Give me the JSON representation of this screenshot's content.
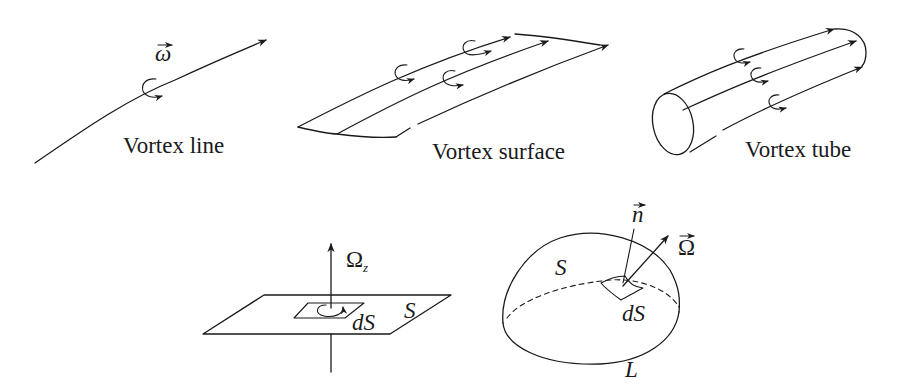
{
  "figure": {
    "panels": [
      {
        "id": "vortex-line",
        "caption": "Vortex line",
        "symbol": "ω",
        "symbol_vector": true
      },
      {
        "id": "vortex-surface",
        "caption": "Vortex surface"
      },
      {
        "id": "vortex-tube",
        "caption": "Vortex tube"
      },
      {
        "id": "plane-flux",
        "omega_label": "Ω",
        "omega_subscript": "z",
        "surface_label": "S",
        "element_label": "dS"
      },
      {
        "id": "curved-surface-flux",
        "normal_label": "n",
        "omega_label": "Ω",
        "surface_label": "S",
        "element_label": "dS",
        "boundary_label": "L"
      }
    ]
  }
}
